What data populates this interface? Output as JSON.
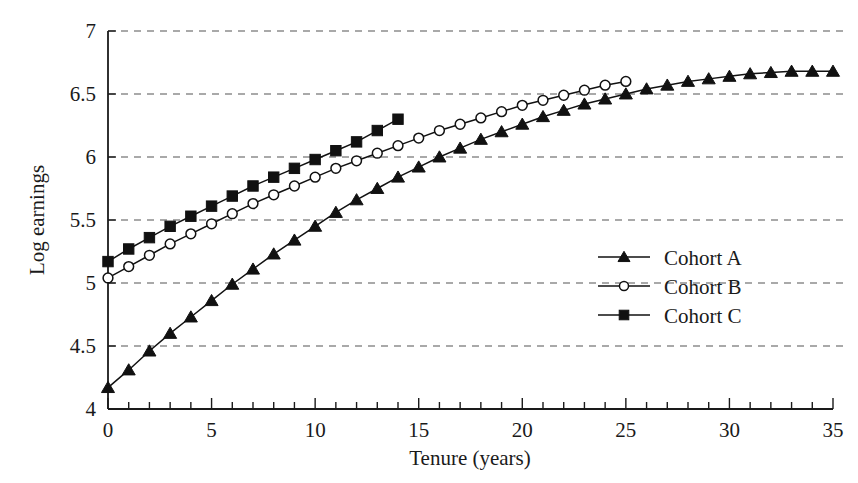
{
  "chart_data": {
    "type": "line",
    "title": "",
    "xlabel": "Tenure (years)",
    "ylabel": "Log earnings",
    "xlim": [
      0,
      35
    ],
    "ylim": [
      4,
      7
    ],
    "xticks": [
      0,
      1,
      2,
      3,
      4,
      5,
      6,
      7,
      8,
      9,
      10,
      11,
      12,
      13,
      14,
      15,
      16,
      17,
      18,
      19,
      20,
      21,
      22,
      23,
      24,
      25,
      26,
      27,
      28,
      29,
      30,
      31,
      32,
      33,
      34,
      35
    ],
    "xtick_labels": [
      "0",
      "5",
      "10",
      "15",
      "20",
      "25",
      "30",
      "35"
    ],
    "xtick_label_values": [
      0,
      5,
      10,
      15,
      20,
      25,
      30,
      35
    ],
    "yticks": [
      4,
      4.5,
      5,
      5.5,
      6,
      6.5,
      7
    ],
    "ytick_labels": [
      "4",
      "4.5",
      "5",
      "5.5",
      "6",
      "6.5",
      "7"
    ],
    "grid": "horizontal-dashed",
    "legend_position": "middle-right",
    "series": [
      {
        "name": "Cohort A",
        "marker": "filled-triangle",
        "x": [
          0,
          1,
          2,
          3,
          4,
          5,
          6,
          7,
          8,
          9,
          10,
          11,
          12,
          13,
          14,
          15,
          16,
          17,
          18,
          19,
          20,
          21,
          22,
          23,
          24,
          25,
          26,
          27,
          28,
          29,
          30,
          31,
          32,
          33,
          34,
          35
        ],
        "values": [
          4.17,
          4.31,
          4.46,
          4.6,
          4.73,
          4.86,
          4.99,
          5.11,
          5.23,
          5.34,
          5.45,
          5.56,
          5.66,
          5.75,
          5.84,
          5.92,
          6.0,
          6.07,
          6.14,
          6.2,
          6.26,
          6.32,
          6.37,
          6.42,
          6.46,
          6.5,
          6.54,
          6.57,
          6.6,
          6.62,
          6.64,
          6.66,
          6.67,
          6.68,
          6.68,
          6.68
        ]
      },
      {
        "name": "Cohort B",
        "marker": "open-circle",
        "x": [
          0,
          1,
          2,
          3,
          4,
          5,
          6,
          7,
          8,
          9,
          10,
          11,
          12,
          13,
          14,
          15,
          16,
          17,
          18,
          19,
          20,
          21,
          22,
          23,
          24,
          25
        ],
        "values": [
          5.04,
          5.13,
          5.22,
          5.31,
          5.39,
          5.47,
          5.55,
          5.63,
          5.7,
          5.77,
          5.84,
          5.91,
          5.97,
          6.03,
          6.09,
          6.15,
          6.21,
          6.26,
          6.31,
          6.36,
          6.41,
          6.45,
          6.49,
          6.53,
          6.57,
          6.6
        ]
      },
      {
        "name": "Cohort C",
        "marker": "filled-square",
        "x": [
          0,
          1,
          2,
          3,
          4,
          5,
          6,
          7,
          8,
          9,
          10,
          11,
          12,
          13,
          14
        ],
        "values": [
          5.17,
          5.27,
          5.36,
          5.45,
          5.53,
          5.61,
          5.69,
          5.77,
          5.84,
          5.91,
          5.98,
          6.05,
          6.12,
          6.21,
          6.3
        ]
      }
    ]
  },
  "legend": {
    "entries": [
      {
        "label": "Cohort A",
        "marker": "filled-triangle"
      },
      {
        "label": "Cohort B",
        "marker": "open-circle"
      },
      {
        "label": "Cohort C",
        "marker": "filled-square"
      }
    ]
  },
  "colors": {
    "ink": "#111111",
    "grid": "#555555",
    "background": "#ffffff"
  }
}
